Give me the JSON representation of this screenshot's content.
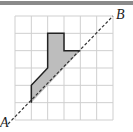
{
  "diagram": {
    "type": "grid-figure",
    "grid": {
      "cols": 6,
      "rows": 6,
      "x0": 15,
      "y0": 16,
      "x1": 113,
      "y1": 120,
      "line_color": "#cfcfcf"
    },
    "shape_vertices_grid": [
      [
        2,
        1
      ],
      [
        3,
        1
      ],
      [
        3,
        2
      ],
      [
        4,
        2
      ],
      [
        1,
        5
      ],
      [
        1,
        4
      ],
      [
        2,
        3
      ],
      [
        2,
        1
      ]
    ],
    "shape_fill": "#bdbdbd",
    "shape_stroke": "#222222",
    "line": {
      "from_label": "A",
      "to_label": "B",
      "style": "dashed",
      "from": [
        8,
        124
      ],
      "to": [
        113,
        16
      ]
    },
    "labels": {
      "A": "A",
      "B": "B"
    }
  }
}
